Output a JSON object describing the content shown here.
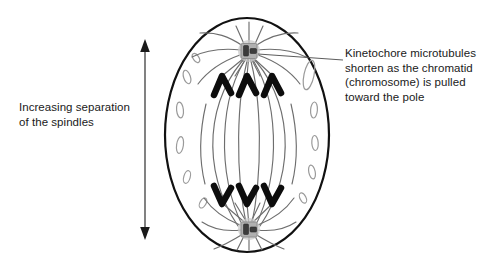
{
  "diagram": {
    "stage": "anaphase",
    "background_color": "#ffffff",
    "ink_color": "#1a1a1a",
    "microtubule_color": "#6e6e6e",
    "organelle_color": "#9a9a9a",
    "centrosome_color": "#b3b3b3",
    "chromatid_color": "#0d0d0d"
  },
  "annotations": {
    "left_label": {
      "text": "Increasing separation\nof the spindles",
      "lines": [
        "Increasing separation",
        "of the spindles"
      ]
    },
    "right_label": {
      "text": "Kinetochore microtubules\nshorten as the chromatid\n(chromosome) is pulled\ntoward the pole",
      "lines": [
        "Kinetochore microtubules",
        "shorten as the chromatid",
        "(chromosome) is pulled",
        "toward the pole"
      ]
    }
  },
  "measure_arrow": {
    "name": "separation-arrow",
    "orientation": "vertical",
    "double_headed": true,
    "x": 145,
    "y_top": 42,
    "y_bottom": 237
  },
  "cell": {
    "name": "cell-membrane",
    "shape": "ellipse",
    "cx": 247,
    "cy": 135,
    "rx": 82,
    "ry": 117,
    "stroke_width": 2.2
  },
  "poles": [
    {
      "name": "top-centrosome",
      "x": 249,
      "y": 51
    },
    {
      "name": "bottom-centrosome",
      "x": 249,
      "y": 229
    }
  ],
  "chromatids": {
    "top_group_count": 3,
    "bottom_group_count": 3,
    "top_y": 78,
    "bottom_y": 201,
    "x_positions": [
      223,
      248,
      273
    ]
  },
  "organelles": {
    "count": 11,
    "description": "small outlined vesicles near the cell periphery"
  }
}
